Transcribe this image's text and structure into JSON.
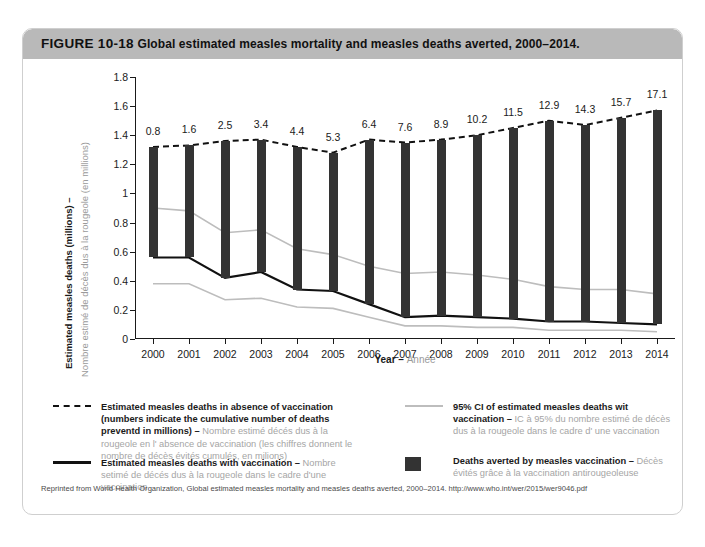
{
  "figure": {
    "number": "FIGURE 10-18",
    "title": "Global estimated measles mortality and measles deaths averted, 2000–2014."
  },
  "axes": {
    "y_label_en": "Estimated measles deaths (millions) –",
    "y_label_fr": "Nombre estimé de décès dus à la rougeole (en millions)",
    "x_label_en": "Year",
    "x_label_sep": " – ",
    "x_label_fr": "Année"
  },
  "legend": {
    "items": [
      {
        "swatch": "dashed-line",
        "en": "Estimated measles deaths in absence of vaccination (numbers indicate the cumulative number of deaths preventd in millions) – ",
        "fr": "Nombre estimé décés dus à la rougeole en l' absence de vaccination (les chiffres donnent le nombre de décès évités cumulés, en milions)"
      },
      {
        "swatch": "gray-line",
        "en": "95% CI of estimated measles deaths wit vaccination – ",
        "fr": "IC à 95% du nombre estimé de décès dus à la rougeole dans le cadre d' une vaccination"
      },
      {
        "swatch": "solid-line",
        "en": "Estimated measles deaths with vaccination – ",
        "fr": "Nombre setimé de décés dus à la rougeole dans le cadre d'une vaccination"
      },
      {
        "swatch": "dark-box",
        "en": "Deaths averted by measles vaccination – ",
        "fr": "Décès évités grâce à la vaccination antirougeoleuse"
      }
    ]
  },
  "footnote": "Reprinted from World Health Organization, Global estimated measles mortality and measles deaths averted, 2000–2014. http://www.who.int/wer/2015/wer9046.pdf",
  "colors": {
    "header_bar": "#b9b9b9",
    "bar_fill": "#333333",
    "ci_line": "#bdbdbd",
    "main_line": "#111111",
    "french_text": "#a5a5a5"
  },
  "chart_data": {
    "type": "line",
    "title": "Global estimated measles mortality and measles deaths averted, 2000–2014",
    "xlabel": "Year – Année",
    "ylabel": "Estimated measles deaths (millions) – Nombre estimé de décès dus à la rougeole (en millions)",
    "ylim": [
      0,
      1.8
    ],
    "yticks": [
      "0",
      "0.2",
      "0.4",
      "0.6",
      "0.8",
      "1",
      "1.2",
      "1.4",
      "1.6",
      "1.8"
    ],
    "grid": false,
    "legend_position": "below-plot",
    "categories": [
      "2000",
      "2001",
      "2002",
      "2003",
      "2004",
      "2005",
      "2006",
      "2007",
      "2008",
      "2009",
      "2010",
      "2011",
      "2012",
      "2013",
      "2014"
    ],
    "series": [
      {
        "name": "Estimated measles deaths in absence of vaccination",
        "style": "dashed",
        "values": [
          1.32,
          1.33,
          1.36,
          1.37,
          1.32,
          1.28,
          1.37,
          1.35,
          1.37,
          1.4,
          1.45,
          1.5,
          1.47,
          1.52,
          1.57
        ]
      },
      {
        "name": "Estimated measles deaths with vaccination",
        "style": "solid",
        "values": [
          0.56,
          0.56,
          0.42,
          0.46,
          0.34,
          0.33,
          0.24,
          0.15,
          0.16,
          0.15,
          0.14,
          0.12,
          0.12,
          0.11,
          0.1
        ]
      },
      {
        "name": "95% CI of estimated measles deaths with vaccination (upper)",
        "style": "gray",
        "values": [
          0.9,
          0.88,
          0.73,
          0.75,
          0.62,
          0.58,
          0.5,
          0.45,
          0.46,
          0.44,
          0.41,
          0.36,
          0.34,
          0.34,
          0.31
        ]
      },
      {
        "name": "95% CI of estimated measles deaths with vaccination (lower)",
        "style": "gray",
        "values": [
          0.38,
          0.38,
          0.27,
          0.28,
          0.22,
          0.21,
          0.15,
          0.09,
          0.09,
          0.08,
          0.08,
          0.06,
          0.06,
          0.06,
          0.05
        ]
      }
    ],
    "bars": {
      "name": "Deaths averted by measles vaccination (cumulative, millions)",
      "labels": [
        "0.8",
        "1.6",
        "2.5",
        "3.4",
        "4.4",
        "5.3",
        "6.4",
        "7.6",
        "8.9",
        "10.2",
        "11.5",
        "12.9",
        "14.3",
        "15.7",
        "17.1"
      ],
      "values": [
        0.8,
        1.6,
        2.5,
        3.4,
        4.4,
        5.3,
        6.4,
        7.6,
        8.9,
        10.2,
        11.5,
        12.9,
        14.3,
        15.7,
        17.1
      ]
    }
  }
}
